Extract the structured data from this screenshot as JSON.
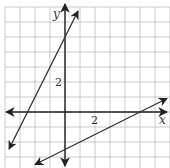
{
  "chart_data": {
    "type": "line",
    "title": "",
    "xlabel": "x",
    "ylabel": "y",
    "grid": true,
    "unit_px": 15,
    "origin_px": [
      65,
      112
    ],
    "xlim": [
      -4,
      7
    ],
    "ylim": [
      -3.7,
      7
    ],
    "tick_labels": {
      "x": [
        "2"
      ],
      "y": [
        "2"
      ]
    },
    "series": [
      {
        "name": "line-1",
        "equation": "y = 2x + 5",
        "slope": 2,
        "intercept": 5,
        "x_intercept": -2.5,
        "endpoints": [
          [
            -3.73,
            -2.47
          ],
          [
            0.87,
            6.73
          ]
        ],
        "arrows_both_ends": true
      },
      {
        "name": "line-2",
        "equation": "y = 0.5x - 2.5",
        "slope": 0.5,
        "intercept": -2.5,
        "x_intercept": 5,
        "endpoints": [
          [
            -2,
            -3.5
          ],
          [
            6.8,
            0.9
          ]
        ],
        "arrows_both_ends": true
      }
    ]
  },
  "labels": {
    "x_axis": "x",
    "y_axis": "y",
    "x_tick": "2",
    "y_tick": "2"
  },
  "colors": {
    "grid": "#bdbdbd",
    "axis": "#222222",
    "line": "#333333",
    "background": "#ffffff"
  }
}
